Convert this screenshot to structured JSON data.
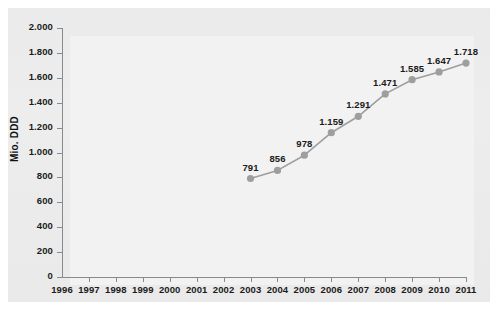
{
  "chart_data": {
    "type": "line",
    "title": "",
    "subtitle": "",
    "xlabel": "",
    "ylabel": "Mio. DDD",
    "x": [
      1996,
      1997,
      1998,
      1999,
      2000,
      2001,
      2002,
      2003,
      2004,
      2005,
      2006,
      2007,
      2008,
      2009,
      2010,
      2011
    ],
    "xtick_labels": [
      "1996",
      "1997",
      "1998",
      "1999",
      "2000",
      "2001",
      "2002",
      "2003",
      "2004",
      "2005",
      "2006",
      "2007",
      "2008",
      "2009",
      "2010",
      "2011"
    ],
    "xlim": [
      1996,
      2011
    ],
    "ylim": [
      0,
      2000
    ],
    "ytick_values": [
      0,
      200,
      400,
      600,
      800,
      1000,
      1200,
      1400,
      1600,
      1800,
      2000
    ],
    "ytick_labels": [
      "0",
      "200",
      "400",
      "600",
      "800",
      "1.000",
      "1.200",
      "1.400",
      "1.600",
      "1.800",
      "2.000"
    ],
    "grid": false,
    "legend": null,
    "series": [
      {
        "name": "Mio. DDD",
        "color": "#9e9e9e",
        "marker": "circle",
        "points": [
          {
            "x": 2003,
            "y": 791,
            "label": "791"
          },
          {
            "x": 2004,
            "y": 856,
            "label": "856"
          },
          {
            "x": 2005,
            "y": 978,
            "label": "978"
          },
          {
            "x": 2006,
            "y": 1159,
            "label": "1.159"
          },
          {
            "x": 2007,
            "y": 1291,
            "label": "1.291"
          },
          {
            "x": 2008,
            "y": 1471,
            "label": "1.471"
          },
          {
            "x": 2009,
            "y": 1585,
            "label": "1.585"
          },
          {
            "x": 2010,
            "y": 1647,
            "label": "1.647"
          },
          {
            "x": 2011,
            "y": 1718,
            "label": "1.718"
          }
        ]
      }
    ]
  },
  "colors": {
    "figure_background": "#ffffff",
    "panel_background": "#ededed",
    "plot_background": "#f2f2f2",
    "axis": "#8a8a8a",
    "series": "#9e9e9e",
    "text": "#1b1b1b"
  }
}
